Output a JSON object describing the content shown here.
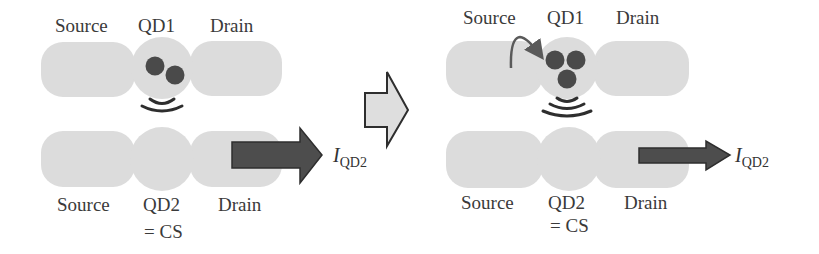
{
  "colors": {
    "electrode_fill": "#dcdcdc",
    "dot_fill": "#4a4a4a",
    "current_arrow_fill": "#4d4d4d",
    "transition_arrow_fill": "#dedede",
    "stroke": "#2e2e2e"
  },
  "left_panel": {
    "top_row": {
      "labels": {
        "source": "Source",
        "dot": "QD1",
        "drain": "Drain"
      },
      "electron_count": 2
    },
    "bottom_row": {
      "labels": {
        "source": "Source",
        "dot": "QD2",
        "dot_sub": "= CS",
        "drain": "Drain"
      },
      "current_label": {
        "main": "I",
        "subscript": "QD2"
      },
      "current_arrow_size": "large"
    }
  },
  "transition_arrow": {
    "icon": "right-arrow-icon"
  },
  "right_panel": {
    "top_row": {
      "labels": {
        "source": "Source",
        "dot": "QD1",
        "drain": "Drain"
      },
      "electron_count": 3,
      "tunneling_arrow": "curved-arrow-icon"
    },
    "bottom_row": {
      "labels": {
        "source": "Source",
        "dot": "QD2",
        "dot_sub": "= CS",
        "drain": "Drain"
      },
      "current_label": {
        "main": "I",
        "subscript": "QD2"
      },
      "current_arrow_size": "small"
    }
  }
}
